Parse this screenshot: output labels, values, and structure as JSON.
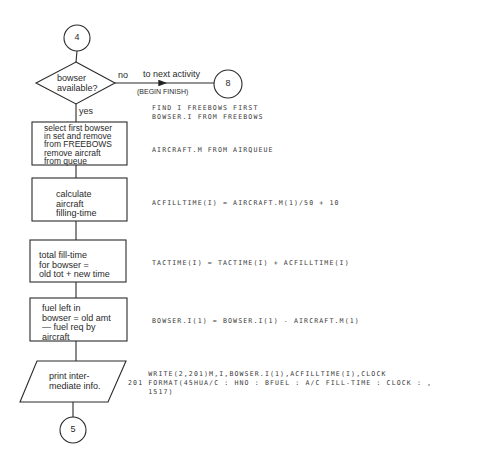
{
  "connectors": {
    "start": "4",
    "exit": "8",
    "end": "5"
  },
  "decision": {
    "text": "bowser\navailable?",
    "no_label": "no",
    "yes_label": "yes",
    "no_branch_label": "to next activity",
    "no_branch_note": "(BEGIN FINISH)"
  },
  "steps": [
    {
      "text": "select first bowser\nin set and remove\nfrom FREEBOWS\nremove aircraft\nfrom queue",
      "code": [
        "FIND I FREEBOWS FIRST",
        "BOWSER.I FROM FREEBOWS",
        "",
        "",
        "AIRCRAFT.M FROM AIRQUEUE"
      ]
    },
    {
      "text": "calculate\naircraft\nfilling-time",
      "code": [
        "ACFILLTIME(I) = AIRCRAFT.M(1)/50 + 10"
      ]
    },
    {
      "text": "total fill-time\nfor bowser =\nold tot + new time",
      "code": [
        "TACTIME(I) = TACTIME(I) + ACFILLTIME(I)"
      ]
    },
    {
      "text": "fuel left in\nbowser = old amt\n— fuel req by\naircraft",
      "code": [
        "BOWSER.I(1) = BOWSER.I(1) - AIRCRAFT.M(1)"
      ]
    }
  ],
  "output_step": {
    "text": "print inter-\nmediate info.",
    "code": [
      "    WRITE(2,201)M,I,BOWSER.I(1),ACFILLTIME(I),CLOCK",
      "201 FORMAT(45HUA/C : HNO : BFUEL : A/C FILL-TIME : CLOCK : ,",
      "    1517)"
    ]
  }
}
